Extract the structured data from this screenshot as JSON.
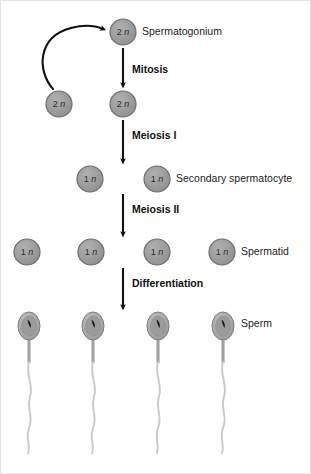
{
  "diagram": {
    "background_color": "#ffffff",
    "border_color": "#e3e3e3",
    "cell_fill_color": "#9a9a9a",
    "cell_stroke_color": "#6e6e6e",
    "arrow_color": "#111111",
    "label_color": "#1b1b1b",
    "sperm_head_fill": "#a8a8a8",
    "sperm_tail_color": "#c9c9c9",
    "stages": [
      {
        "id": "mitosis",
        "label": "Mitosis"
      },
      {
        "id": "meiosis-1",
        "label": "Meiosis I"
      },
      {
        "id": "meiosis-2",
        "label": "Meiosis II"
      },
      {
        "id": "differentiation",
        "label": "Differentiation"
      }
    ],
    "cell_labels": [
      {
        "id": "spermatogonium",
        "label": "Spermatogonium"
      },
      {
        "id": "secondary-spermatocyte",
        "label": "Secondary spermatocyte"
      },
      {
        "id": "spermatid",
        "label": "Spermatid"
      },
      {
        "id": "sperm",
        "label": "Sperm"
      }
    ],
    "rows": [
      {
        "id": "row-spermatogonium",
        "ploidy": "2n",
        "cells": [
          {
            "cx": 122,
            "cy": 31,
            "r": 13
          }
        ]
      },
      {
        "id": "row-stem-and-daughter",
        "ploidy": "2n",
        "cells": [
          {
            "cx": 58,
            "cy": 103,
            "r": 13
          },
          {
            "cx": 122,
            "cy": 103,
            "r": 13
          }
        ]
      },
      {
        "id": "row-secondary-spermatocyte",
        "ploidy": "1n",
        "cells": [
          {
            "cx": 89,
            "cy": 178,
            "r": 13
          },
          {
            "cx": 156,
            "cy": 178,
            "r": 13
          }
        ]
      },
      {
        "id": "row-spermatid",
        "ploidy": "1n",
        "cells": [
          {
            "cx": 26,
            "cy": 251,
            "r": 13
          },
          {
            "cx": 90,
            "cy": 251,
            "r": 13
          },
          {
            "cx": 156,
            "cy": 251,
            "r": 13
          },
          {
            "cx": 221,
            "cy": 251,
            "r": 13
          }
        ]
      },
      {
        "id": "row-sperm",
        "ploidy": "",
        "cells": [
          {
            "cx": 28,
            "cy": 325,
            "r": 0
          },
          {
            "cx": 92,
            "cy": 325,
            "r": 0
          },
          {
            "cx": 157,
            "cy": 325,
            "r": 0
          },
          {
            "cx": 222,
            "cy": 325,
            "r": 0
          }
        ]
      }
    ]
  }
}
